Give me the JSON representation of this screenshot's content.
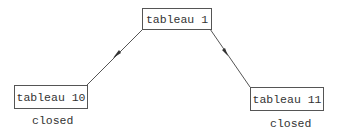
{
  "diagram": {
    "type": "tree",
    "nodes": [
      {
        "id": "t1",
        "label": "tableau 1",
        "status": ""
      },
      {
        "id": "t10",
        "label": "tableau 10",
        "status": "closed"
      },
      {
        "id": "t11",
        "label": "tableau 11",
        "status": "closed"
      }
    ],
    "edges": [
      {
        "from": "tableau 1",
        "to": "tableau 10",
        "directed": true
      },
      {
        "from": "tableau 1",
        "to": "tableau 11",
        "directed": true
      }
    ],
    "colors": {
      "line": "#555555",
      "text": "#333333",
      "background": "#ffffff"
    }
  }
}
